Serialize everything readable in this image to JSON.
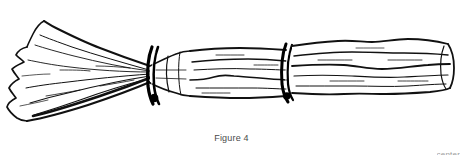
{
  "document": {
    "background_color": "#ffffff",
    "width": 463,
    "height": 155
  },
  "figure": {
    "caption": "Figure 4",
    "style": "black-and-white pen line drawing",
    "ink_color": "#000000",
    "fill_color": "#ffffff",
    "orientation": "horizontal, bristle head at left, handle extending to right",
    "parts": {
      "bristle_head_label": "flared bristle head",
      "binding_band_1_label": "upper binding band",
      "binding_band_2_label": "lower binding band",
      "handle_label": "wooden handle",
      "handle_tip_label": "handle end"
    }
  },
  "footer": {
    "fragment_text": "center"
  }
}
